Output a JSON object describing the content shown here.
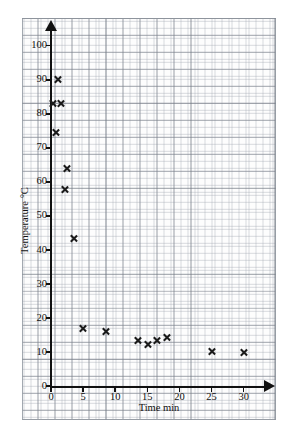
{
  "chart_data": {
    "type": "scatter",
    "title": "",
    "xlabel": "Time min",
    "ylabel": "Temperature °C",
    "xlim": [
      0,
      32
    ],
    "ylim": [
      0,
      105
    ],
    "xticks": [
      0,
      5,
      10,
      15,
      20,
      25,
      30
    ],
    "yticks": [
      0,
      10,
      20,
      30,
      40,
      50,
      60,
      70,
      80,
      90,
      100
    ],
    "grid": true,
    "grid_style": "graph paper, 1 unit fine squares with 5 unit major squares",
    "legend": "none",
    "marker": "x",
    "marker_color": "#1b1b1b",
    "points": [
      {
        "x": 0.3,
        "y": 83.0
      },
      {
        "x": 1.1,
        "y": 90.2
      },
      {
        "x": 1.6,
        "y": 83.0
      },
      {
        "x": 0.8,
        "y": 74.5
      },
      {
        "x": 2.4,
        "y": 63.8
      },
      {
        "x": 2.2,
        "y": 57.8
      },
      {
        "x": 3.5,
        "y": 43.5
      },
      {
        "x": 5.0,
        "y": 17.0
      },
      {
        "x": 8.5,
        "y": 16.0
      },
      {
        "x": 13.5,
        "y": 13.3
      },
      {
        "x": 15.0,
        "y": 12.2
      },
      {
        "x": 16.5,
        "y": 13.3
      },
      {
        "x": 18.0,
        "y": 14.3
      },
      {
        "x": 25.0,
        "y": 10.3
      },
      {
        "x": 30.0,
        "y": 10.0
      }
    ]
  },
  "axes": {
    "x_title": "Time min",
    "y_title": "Temperature °C",
    "x_tick_labels": [
      "0",
      "5",
      "10",
      "15",
      "20",
      "25",
      "30"
    ],
    "y_tick_labels": [
      "0",
      "10",
      "20",
      "30",
      "40",
      "50",
      "60",
      "70",
      "80",
      "90",
      "100"
    ]
  },
  "colors": {
    "axis": "#111111",
    "marker": "#1b1b1b",
    "grid_fine": "#a0a6b0",
    "grid_major": "#787e88",
    "paper": "#fdfdfd",
    "frame": "#9aa0a8"
  }
}
